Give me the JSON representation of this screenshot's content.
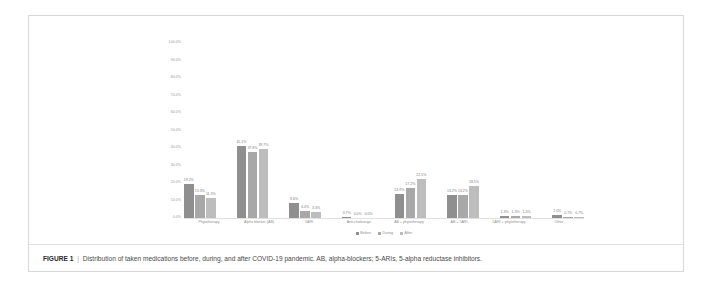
{
  "figure": {
    "caption_number": "FIGURE 1",
    "caption_separator": "|",
    "caption_text": "Distribution of taken medications before, during, and after COVID-19 pandemic. AB, alpha-blockers; 5-ARIs, 5-alpha reductase inhibitors."
  },
  "chart_data": {
    "type": "bar",
    "title": "",
    "subtitle": "",
    "xlabel": "",
    "ylabel": "",
    "ylim": [
      0,
      100
    ],
    "grid": false,
    "legend_position": "bottom",
    "value_suffix": "%",
    "categories": [
      "Phytotherapy",
      "Alpha blocker (AB)",
      "5ARI",
      "Anti-cholinergic",
      "AB + phytotherapy",
      "AB + 5ARI",
      "5ARI + phytotherapy",
      "Other"
    ],
    "ytick_labels": [
      "0.0%",
      "10.0%",
      "20.0%",
      "30.0%",
      "40.0%",
      "50.0%",
      "60.0%",
      "70.0%",
      "80.0%",
      "90.0%",
      "100.0%"
    ],
    "ytick_values": [
      0,
      10,
      20,
      30,
      40,
      50,
      60,
      70,
      80,
      90,
      100
    ],
    "series": [
      {
        "name": "Before",
        "color": "#8f8f8f",
        "values": [
          19.2,
          41.1,
          8.6,
          0.7,
          13.9,
          13.2,
          1.3,
          2.0
        ],
        "labels": [
          "19.2%",
          "41.1%",
          "8.6%",
          "0.7%",
          "13.9%",
          "13.2%",
          "1.3%",
          "2.0%"
        ]
      },
      {
        "name": "During",
        "color": "#a8a8a8",
        "values": [
          13.3,
          37.8,
          4.0,
          0.0,
          17.2,
          13.2,
          1.3,
          0.7
        ],
        "labels": [
          "13.3%",
          "37.8%",
          "4.0%",
          "0.0%",
          "17.2%",
          "13.2%",
          "1.3%",
          "0.7%"
        ]
      },
      {
        "name": "After",
        "color": "#bdbdbd",
        "values": [
          11.3,
          39.7,
          3.3,
          0.0,
          22.5,
          18.5,
          1.3,
          0.7
        ],
        "labels": [
          "11.3%",
          "39.7%",
          "3.3%",
          "0.0%",
          "22.5%",
          "18.5%",
          "1.3%",
          "0.7%"
        ]
      }
    ]
  }
}
